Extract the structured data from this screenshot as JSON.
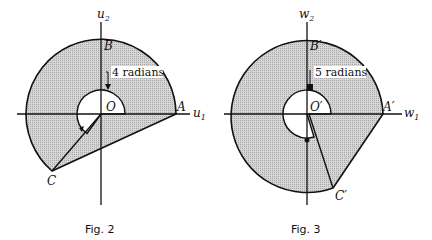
{
  "figures": [
    {
      "caption": "Fig. 2",
      "axis_x": "u",
      "axis_x_sub": "1",
      "axis_y": "u",
      "axis_y_sub": "2",
      "origin_label": "O",
      "points": {
        "A": "A",
        "B": "B",
        "C": "C"
      },
      "angle_label": "4 radians",
      "angle_radians": 4
    },
    {
      "caption": "Fig. 3",
      "axis_x": "w",
      "axis_x_sub": "1",
      "axis_y": "w",
      "axis_y_sub": "2",
      "origin_label": "O′",
      "points": {
        "A": "A′",
        "B": "B′",
        "C": "C′"
      },
      "angle_label": "5 radians",
      "angle_radians": 5
    }
  ],
  "colors": {
    "fill": "#cfcfcf",
    "stroke": "#111111",
    "background": "#ffffff"
  }
}
